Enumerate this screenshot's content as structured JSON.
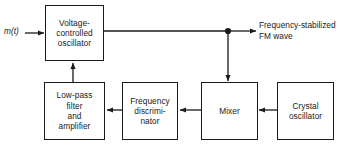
{
  "diagram": {
    "line_color": "#1a1a1a",
    "background": "#ffffff",
    "blocks": [
      {
        "id": "vco",
        "label": "Voltage-\ncontrolled\noscillator"
      },
      {
        "id": "lpf",
        "label": "Low-pass\nfilter\nand\namplifier"
      },
      {
        "id": "fd",
        "label": "Frequency\ndiscrimi-\nnator"
      },
      {
        "id": "mixer",
        "label": "Mixer"
      },
      {
        "id": "xtal",
        "label": "Crystal\noscillator"
      }
    ],
    "labels": {
      "input": "m(t)",
      "output": "Frequency-stabilized\nFM wave"
    },
    "connections": [
      {
        "from": "input",
        "to": "vco",
        "kind": "arrow"
      },
      {
        "from": "vco",
        "to": "output",
        "kind": "arrow"
      },
      {
        "from": "tap",
        "to": "mixer",
        "kind": "arrow"
      },
      {
        "from": "xtal",
        "to": "mixer",
        "kind": "arrow"
      },
      {
        "from": "mixer",
        "to": "fd",
        "kind": "arrow"
      },
      {
        "from": "fd",
        "to": "lpf",
        "kind": "arrow"
      },
      {
        "from": "lpf",
        "to": "vco",
        "kind": "arrow"
      }
    ],
    "junction": {
      "name": "signal-tap-node",
      "x": 228,
      "y": 31
    }
  }
}
